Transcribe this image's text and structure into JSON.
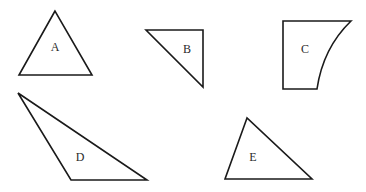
{
  "diagram": {
    "stroke_color": "#1a1a1a",
    "background": "#ffffff",
    "shapes": [
      {
        "id": "A",
        "label": "A",
        "kind": "triangle",
        "points": "55,11 19,75 92,75",
        "label_x": 55,
        "label_y": 48
      },
      {
        "id": "B",
        "label": "B",
        "kind": "right-triangle",
        "points": "146,30 203,30 203,87",
        "label_x": 187,
        "label_y": 50
      },
      {
        "id": "C",
        "label": "C",
        "kind": "curved-quadrilateral",
        "path": "M283,21 L351,21 Q323,48 317,89 L283,89 Z",
        "label_x": 305,
        "label_y": 50
      },
      {
        "id": "D",
        "label": "D",
        "kind": "obtuse-triangle",
        "points": "18,93 71,180 147,180",
        "label_x": 80,
        "label_y": 158
      },
      {
        "id": "E",
        "label": "E",
        "kind": "triangle",
        "points": "247,118 225,179 312,179",
        "label_x": 253,
        "label_y": 158
      }
    ]
  }
}
